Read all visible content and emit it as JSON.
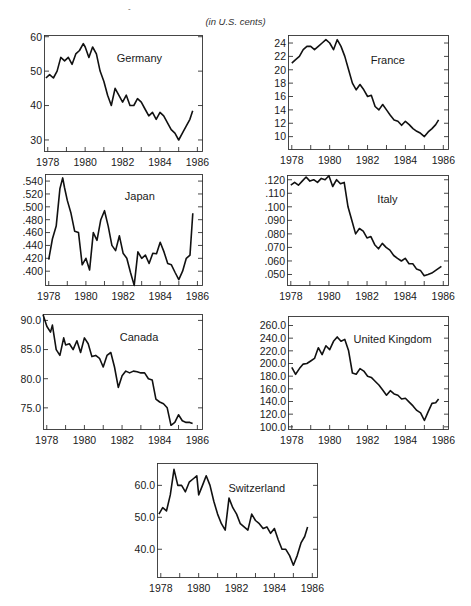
{
  "page": {
    "subtitle": "(in U.S. cents)"
  },
  "chart_data": [
    {
      "type": "line",
      "title": "Germany",
      "xlabel": "",
      "ylabel": "U.S. cents",
      "xlim": [
        1977.8,
        1986.3
      ],
      "ylim": [
        26.5,
        60.5
      ],
      "x_ticks": [
        1978,
        1980,
        1982,
        1984,
        1986
      ],
      "y_ticks": [
        30,
        40,
        50,
        60
      ],
      "y_tick_labels": [
        "30",
        "40",
        "50",
        "60"
      ],
      "frame": {
        "left": 44,
        "top": 35,
        "right": 203,
        "bottom": 152
      },
      "title_pos": [
        0.6,
        0.2
      ],
      "x": [
        1977.9,
        1978.1,
        1978.3,
        1978.5,
        1978.7,
        1978.9,
        1979.1,
        1979.3,
        1979.5,
        1979.7,
        1979.9,
        1980.0,
        1980.2,
        1980.4,
        1980.6,
        1980.8,
        1981.0,
        1981.2,
        1981.4,
        1981.6,
        1981.8,
        1982.0,
        1982.2,
        1982.4,
        1982.6,
        1982.8,
        1983.0,
        1983.2,
        1983.4,
        1983.6,
        1983.8,
        1984.0,
        1984.2,
        1984.4,
        1984.6,
        1984.8,
        1985.0,
        1985.2,
        1985.4,
        1985.6,
        1985.75
      ],
      "values": [
        48,
        49,
        48,
        50,
        54,
        53,
        54,
        52,
        55,
        56,
        58,
        57,
        54,
        57,
        55,
        50,
        47,
        43,
        40,
        45,
        43,
        41,
        43,
        40,
        40,
        42,
        41,
        39,
        37,
        38,
        36,
        38,
        37,
        35,
        33,
        32,
        30,
        32,
        34,
        36,
        38.5
      ]
    },
    {
      "type": "line",
      "title": "France",
      "xlim": [
        1977.8,
        1986.3
      ],
      "ylim": [
        8,
        25.2
      ],
      "x_ticks": [
        1978,
        1980,
        1982,
        1984,
        1986
      ],
      "y_ticks": [
        10,
        12,
        14,
        16,
        18,
        20,
        22,
        24
      ],
      "y_tick_labels": [
        "10",
        "12",
        "14",
        "16",
        "18",
        "20",
        "22",
        "24"
      ],
      "frame": {
        "left": 288,
        "top": 35,
        "right": 449,
        "bottom": 150
      },
      "title_pos": [
        0.62,
        0.22
      ],
      "x": [
        1978.0,
        1978.2,
        1978.4,
        1978.6,
        1978.8,
        1979.0,
        1979.2,
        1979.4,
        1979.6,
        1979.8,
        1980.0,
        1980.2,
        1980.4,
        1980.6,
        1980.8,
        1981.0,
        1981.2,
        1981.4,
        1981.6,
        1981.8,
        1982.0,
        1982.2,
        1982.4,
        1982.6,
        1982.8,
        1983.0,
        1983.2,
        1983.4,
        1983.6,
        1983.8,
        1984.0,
        1984.2,
        1984.4,
        1984.6,
        1984.8,
        1985.0,
        1985.2,
        1985.4,
        1985.6,
        1985.75
      ],
      "values": [
        21,
        21.5,
        22,
        23,
        23.5,
        23.5,
        23,
        23.5,
        24,
        24.5,
        24,
        23,
        24.5,
        23.5,
        22,
        20,
        18,
        17,
        17.8,
        17,
        16,
        16.2,
        14.5,
        14,
        14.8,
        14,
        13.2,
        12.5,
        12.3,
        11.7,
        12.3,
        11.8,
        11.2,
        10.8,
        10.5,
        10,
        10.7,
        11.2,
        11.8,
        12.5
      ]
    },
    {
      "type": "line",
      "title": "Japan",
      "xlim": [
        1977.8,
        1986.3
      ],
      "ylim": [
        0.377,
        0.551
      ],
      "x_ticks": [
        1978,
        1980,
        1982,
        1984,
        1986
      ],
      "y_ticks": [
        0.4,
        0.42,
        0.44,
        0.46,
        0.48,
        0.5,
        0.52,
        0.54
      ],
      "y_tick_labels": [
        ".400",
        ".420",
        ".440",
        ".460",
        ".480",
        ".500",
        ".520",
        ".540"
      ],
      "frame": {
        "left": 45,
        "top": 174,
        "right": 203,
        "bottom": 286
      },
      "title_pos": [
        0.6,
        0.2
      ],
      "x": [
        1978.0,
        1978.2,
        1978.4,
        1978.6,
        1978.75,
        1978.85,
        1979.0,
        1979.2,
        1979.4,
        1979.6,
        1979.8,
        1980.0,
        1980.2,
        1980.4,
        1980.6,
        1980.8,
        1981.0,
        1981.2,
        1981.4,
        1981.6,
        1981.8,
        1982.0,
        1982.2,
        1982.4,
        1982.6,
        1982.8,
        1983.0,
        1983.2,
        1983.4,
        1983.6,
        1983.8,
        1984.0,
        1984.2,
        1984.4,
        1984.6,
        1984.8,
        1985.0,
        1985.2,
        1985.4,
        1985.6,
        1985.75
      ],
      "values": [
        0.418,
        0.45,
        0.47,
        0.528,
        0.545,
        0.53,
        0.51,
        0.49,
        0.462,
        0.46,
        0.41,
        0.42,
        0.402,
        0.46,
        0.448,
        0.48,
        0.494,
        0.47,
        0.44,
        0.432,
        0.455,
        0.428,
        0.42,
        0.398,
        0.378,
        0.43,
        0.42,
        0.425,
        0.412,
        0.428,
        0.427,
        0.445,
        0.43,
        0.412,
        0.41,
        0.398,
        0.387,
        0.4,
        0.42,
        0.425,
        0.49
      ]
    },
    {
      "type": "line",
      "title": "Italy",
      "xlim": [
        1977.8,
        1986.3
      ],
      "ylim": [
        0.0415,
        0.1235
      ],
      "x_ticks": [
        1978,
        1980,
        1982,
        1984,
        1986
      ],
      "y_ticks": [
        0.05,
        0.06,
        0.07,
        0.08,
        0.09,
        0.1,
        0.11,
        0.12
      ],
      "y_tick_labels": [
        ".050",
        ".060",
        ".070",
        ".080",
        ".090",
        ".100",
        ".110",
        ".120"
      ],
      "frame": {
        "left": 287,
        "top": 175,
        "right": 449,
        "bottom": 286
      },
      "title_pos": [
        0.62,
        0.22
      ],
      "x": [
        1978.0,
        1978.2,
        1978.4,
        1978.6,
        1978.8,
        1979.0,
        1979.2,
        1979.4,
        1979.6,
        1979.8,
        1980.0,
        1980.2,
        1980.4,
        1980.6,
        1980.8,
        1981.0,
        1981.2,
        1981.4,
        1981.6,
        1981.8,
        1982.0,
        1982.2,
        1982.4,
        1982.6,
        1982.8,
        1983.0,
        1983.2,
        1983.4,
        1983.6,
        1983.8,
        1984.0,
        1984.2,
        1984.4,
        1984.6,
        1984.8,
        1985.0,
        1985.2,
        1985.4,
        1985.6,
        1985.9
      ],
      "values": [
        0.116,
        0.118,
        0.116,
        0.119,
        0.122,
        0.119,
        0.12,
        0.118,
        0.121,
        0.12,
        0.123,
        0.115,
        0.12,
        0.117,
        0.118,
        0.1,
        0.09,
        0.08,
        0.084,
        0.082,
        0.077,
        0.078,
        0.072,
        0.069,
        0.073,
        0.07,
        0.068,
        0.064,
        0.062,
        0.06,
        0.062,
        0.058,
        0.058,
        0.054,
        0.053,
        0.049,
        0.05,
        0.051,
        0.053,
        0.056
      ]
    },
    {
      "type": "line",
      "title": "Canada",
      "xlim": [
        1977.8,
        1986.3
      ],
      "ylim": [
        71.2,
        91.1
      ],
      "x_ticks": [
        1978,
        1980,
        1982,
        1984,
        1986
      ],
      "y_ticks": [
        75,
        80,
        85,
        90
      ],
      "y_tick_labels": [
        "75.0",
        "80.0",
        "85.0",
        "90.0"
      ],
      "frame": {
        "left": 43,
        "top": 314,
        "right": 203,
        "bottom": 430
      },
      "title_pos": [
        0.6,
        0.2
      ],
      "x": [
        1977.8,
        1978.0,
        1978.2,
        1978.3,
        1978.5,
        1978.7,
        1978.9,
        1979.0,
        1979.2,
        1979.4,
        1979.6,
        1979.8,
        1980.0,
        1980.2,
        1980.4,
        1980.6,
        1980.8,
        1981.0,
        1981.2,
        1981.4,
        1981.6,
        1981.8,
        1982.0,
        1982.2,
        1982.4,
        1982.6,
        1982.8,
        1983.0,
        1983.2,
        1983.4,
        1983.6,
        1983.8,
        1984.0,
        1984.2,
        1984.4,
        1984.6,
        1984.8,
        1985.0,
        1985.2,
        1985.4,
        1985.6,
        1985.75
      ],
      "values": [
        91,
        89,
        88,
        89.2,
        85,
        84,
        87,
        85.8,
        86,
        85,
        86.5,
        84.5,
        87,
        86,
        83.8,
        84,
        83.5,
        82,
        84,
        84.5,
        82,
        78.5,
        80.5,
        81.3,
        81,
        81.3,
        81.2,
        81,
        81,
        80,
        79.8,
        76.5,
        76,
        75.7,
        75,
        72,
        72.5,
        73.8,
        72.8,
        72.5,
        72.5,
        72.3
      ]
    },
    {
      "type": "line",
      "title": "United Kingdom",
      "xlim": [
        1977.8,
        1986.3
      ],
      "ylim": [
        95,
        275
      ],
      "x_ticks": [
        1978,
        1980,
        1982,
        1984,
        1986
      ],
      "y_ticks": [
        100,
        120,
        140,
        160,
        180,
        200,
        220,
        240,
        260
      ],
      "y_tick_labels": [
        "100.0",
        "120.0",
        "140.0",
        "160.0",
        "180.0",
        "200.0",
        "220.0",
        "240.0",
        "260.0"
      ],
      "frame": {
        "left": 288,
        "top": 316,
        "right": 449,
        "bottom": 430
      },
      "title_pos": [
        0.65,
        0.2
      ],
      "x": [
        1978.0,
        1978.2,
        1978.4,
        1978.6,
        1978.8,
        1979.0,
        1979.2,
        1979.4,
        1979.6,
        1979.8,
        1980.0,
        1980.2,
        1980.4,
        1980.6,
        1980.8,
        1981.0,
        1981.2,
        1981.4,
        1981.6,
        1981.8,
        1982.0,
        1982.2,
        1982.4,
        1982.6,
        1982.8,
        1983.0,
        1983.2,
        1983.4,
        1983.6,
        1983.8,
        1984.0,
        1984.2,
        1984.4,
        1984.6,
        1984.8,
        1985.0,
        1985.2,
        1985.4,
        1985.6,
        1985.75
      ],
      "values": [
        194,
        183,
        192,
        199,
        200,
        204,
        208,
        225,
        214,
        228,
        222,
        235,
        242,
        235,
        238,
        220,
        185,
        183,
        192,
        188,
        180,
        178,
        172,
        166,
        158,
        150,
        157,
        152,
        150,
        144,
        145,
        139,
        133,
        126,
        122,
        110,
        124,
        137,
        138,
        144
      ]
    },
    {
      "type": "line",
      "title": "Switzerland",
      "xlim": [
        1977.8,
        1986.3
      ],
      "ylim": [
        31,
        67
      ],
      "x_ticks": [
        1978,
        1980,
        1982,
        1984,
        1986
      ],
      "y_ticks": [
        40,
        50,
        60
      ],
      "y_tick_labels": [
        "40.0",
        "50.0",
        "60.0"
      ],
      "frame": {
        "left": 157,
        "top": 463,
        "right": 318,
        "bottom": 578
      },
      "title_pos": [
        0.62,
        0.22
      ],
      "x": [
        1977.9,
        1978.1,
        1978.3,
        1978.5,
        1978.7,
        1978.9,
        1979.1,
        1979.3,
        1979.5,
        1979.7,
        1979.9,
        1980.0,
        1980.2,
        1980.4,
        1980.6,
        1980.8,
        1981.0,
        1981.2,
        1981.4,
        1981.6,
        1981.8,
        1982.0,
        1982.2,
        1982.4,
        1982.6,
        1982.8,
        1983.0,
        1983.2,
        1983.4,
        1983.6,
        1983.8,
        1984.0,
        1984.2,
        1984.4,
        1984.6,
        1984.8,
        1985.0,
        1985.2,
        1985.4,
        1985.6,
        1985.75
      ],
      "values": [
        51,
        53,
        52,
        57,
        65,
        60,
        60,
        58,
        61,
        62,
        63,
        57,
        60,
        63,
        60,
        55,
        51,
        48,
        46,
        56,
        53,
        51,
        48,
        47,
        46,
        51,
        49,
        48,
        46.5,
        47,
        45,
        46.5,
        43,
        40,
        40,
        38,
        35,
        38,
        42,
        44,
        47
      ]
    }
  ]
}
